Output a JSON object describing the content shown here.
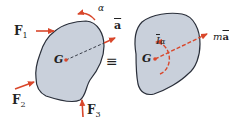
{
  "diagram": {
    "colors": {
      "body_fill": "#c9d0db",
      "body_stroke": "#2a2f3a",
      "arrow": "#d9472b",
      "text": "#222222"
    },
    "left_body": {
      "center_label": "G",
      "forces": [
        {
          "name": "F",
          "sub": "1"
        },
        {
          "name": "F",
          "sub": "2"
        },
        {
          "name": "F",
          "sub": "3"
        }
      ],
      "angular_accel_label": "α",
      "accel_label": "a"
    },
    "equivalence_symbol": "≡",
    "right_body": {
      "center_label": "G",
      "moment_label_I": "I",
      "moment_label_alpha": "α",
      "inertia_force_m": "m",
      "inertia_force_a": "a"
    }
  }
}
